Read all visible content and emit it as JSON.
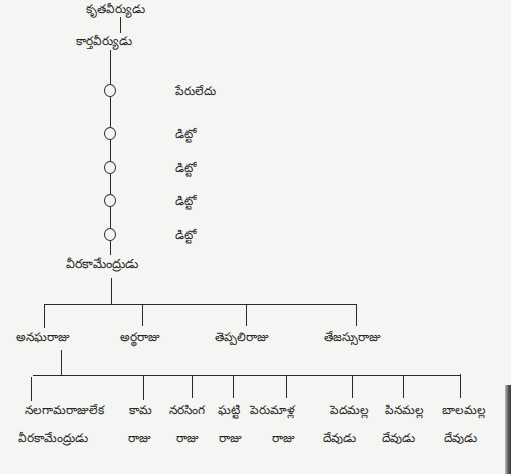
{
  "diagram": {
    "type": "genealogy-tree",
    "colors": {
      "ink": "#2a2a2a",
      "paper": "#f5f5f3"
    },
    "root_partial": {
      "label": "కృతవీర్యుడు"
    },
    "ancestor": {
      "label": "కార్తవీర్యుడు"
    },
    "unnamed_generations": [
      {
        "label": "పేరులేదు"
      },
      {
        "label": "డిట్టో"
      },
      {
        "label": "డిట్టో"
      },
      {
        "label": "డిట్టో"
      },
      {
        "label": "డిట్టో"
      }
    ],
    "progenitor": {
      "label": "వీరకామేంద్రుడు"
    },
    "sons": [
      {
        "label": "అనఘరాజు"
      },
      {
        "label": "అర్థరాజు"
      },
      {
        "label": "తెప్పలిరాజు"
      },
      {
        "label": "తేజస్సురాజు"
      }
    ],
    "grandsons": [
      {
        "line1": "నలగామరాజులేక",
        "line2": "వీరకామేంద్రుడు"
      },
      {
        "line1": "కామ",
        "line2": "రాజు"
      },
      {
        "line1": "నరసింగ",
        "line2": "రాజు"
      },
      {
        "line1": "ఘట్టి",
        "line2": "రాజు"
      },
      {
        "line1": "పెరుమాళ్ల",
        "line2": "రాజు"
      },
      {
        "line1": "పెదమల్ల",
        "line2": "దేవుడు"
      },
      {
        "line1": "పినమల్ల",
        "line2": "దేవుడు"
      },
      {
        "line1": "బాలమల్ల",
        "line2": "దేవుడు"
      }
    ]
  }
}
